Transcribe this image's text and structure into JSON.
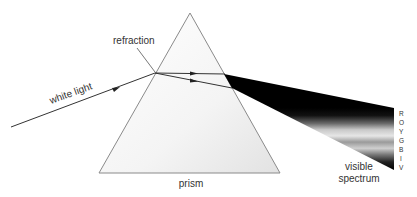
{
  "diagram": {
    "labels": {
      "refraction": "refraction",
      "white_light": "white light",
      "prism": "prism",
      "visible": "visible",
      "spectrum": "spectrum"
    },
    "spectrum_letters": [
      "R",
      "O",
      "Y",
      "G",
      "B",
      "I",
      "V"
    ],
    "colors": {
      "line": "#333333",
      "prism_edge": "#8a8a8a",
      "beam_dark": "#000000",
      "beam_light": "#d8d8d8"
    }
  }
}
